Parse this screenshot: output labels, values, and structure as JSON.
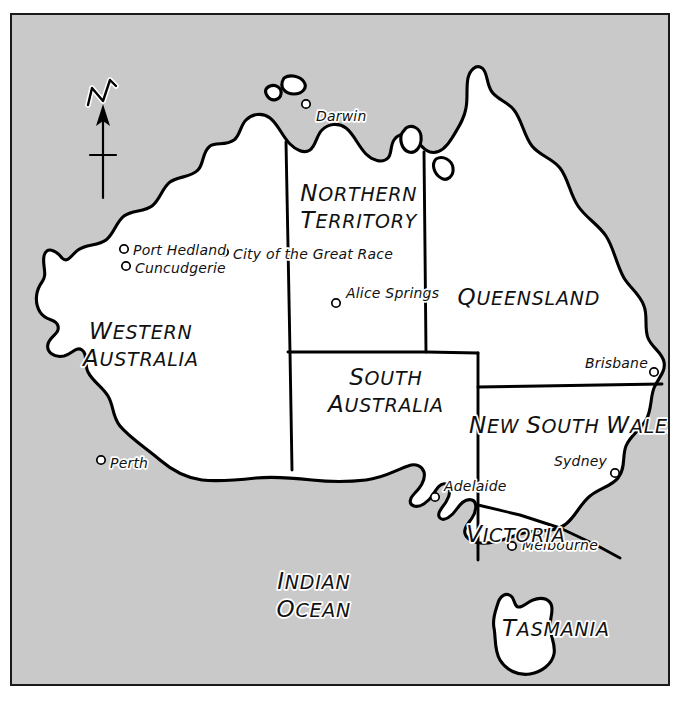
{
  "map": {
    "title": "Map of Australia",
    "background_color": "#c9c9c9",
    "land_color": "#ffffff",
    "outline_color": "#000000",
    "frame_color": "#1a1a1a",
    "compass": {
      "label": "N",
      "icon": "north-arrow-icon"
    },
    "states": [
      {
        "id": "western-australia",
        "line1": "W",
        "line1rest": "ESTERN",
        "line2": "A",
        "line2rest": "USTRALIA",
        "x": 134,
        "y": 339,
        "line_gap": 27
      },
      {
        "id": "northern-territory",
        "line1": "N",
        "line1rest": "ORTHERN",
        "line2": "T",
        "line2rest": "ERRITORY",
        "x": 300,
        "y": 201,
        "line_gap": 27
      },
      {
        "id": "south-australia",
        "line1": "S",
        "line1rest": "OUTH",
        "line2": "A",
        "line2rest": "USTRALIA",
        "x": 327,
        "y": 385,
        "line_gap": 27
      },
      {
        "id": "queensland",
        "line1": "Q",
        "line1rest": "UEENSLAND",
        "line2": "",
        "line2rest": "",
        "x": 468,
        "y": 297,
        "line_gap": 0
      },
      {
        "id": "new-south-wales",
        "line1": "N",
        "line1rest": "EW ",
        "line2": "",
        "line2rest": "",
        "x": 472,
        "y": 425,
        "line_gap": 0,
        "full": "NEW SOUTH WALES"
      },
      {
        "id": "victoria",
        "line1": "V",
        "line1rest": "ICTORIA",
        "line2": "",
        "line2rest": "",
        "x": 463,
        "y": 534,
        "line_gap": 0
      },
      {
        "id": "tasmania",
        "line1": "T",
        "line1rest": "ASMANIA",
        "line2": "",
        "line2rest": "",
        "x": 489,
        "y": 628,
        "line_gap": 0
      }
    ],
    "state_names": {
      "western_australia": "WESTERN AUSTRALIA",
      "northern_territory": "NORTHERN TERRITORY",
      "south_australia": "SOUTH AUSTRALIA",
      "queensland": "QUEENSLAND",
      "new_south_wales": "NEW SOUTH WALES",
      "victoria": "VICTORIA",
      "tasmania": "TASMANIA"
    },
    "ocean": {
      "name": "INDIAN OCEAN",
      "line1": "I",
      "line1rest": "NDIAN",
      "line2": "O",
      "line2rest": "CEAN",
      "x": 262,
      "y": 581
    },
    "cities": [
      {
        "name": "Darwin",
        "dot_x": 306,
        "dot_y": 104,
        "label_x": 316,
        "label_y": 121,
        "anchor": "start"
      },
      {
        "name": "Port Hedland",
        "dot_x": 124,
        "dot_y": 249,
        "label_x": 133,
        "label_y": 255,
        "anchor": "start"
      },
      {
        "name": "Cuncudgerie",
        "dot_x": 126,
        "dot_y": 266,
        "label_x": 135,
        "label_y": 273,
        "anchor": "start"
      },
      {
        "name": "City of the Great Race",
        "dot_x": 224,
        "dot_y": 252,
        "label_x": 233,
        "label_y": 259,
        "anchor": "start"
      },
      {
        "name": "Alice Springs",
        "dot_x": 336,
        "dot_y": 303,
        "label_x": 346,
        "label_y": 298,
        "anchor": "start"
      },
      {
        "name": "Brisbane",
        "dot_x": 654,
        "dot_y": 372,
        "label_x": 648,
        "label_y": 368,
        "anchor": "end"
      },
      {
        "name": "Perth",
        "dot_x": 101,
        "dot_y": 460,
        "label_x": 110,
        "label_y": 468,
        "anchor": "start"
      },
      {
        "name": "Sydney",
        "dot_x": 615,
        "dot_y": 473,
        "label_x": 607,
        "label_y": 466,
        "anchor": "end"
      },
      {
        "name": "Adelaide",
        "dot_x": 435,
        "dot_y": 497,
        "label_x": 444,
        "label_y": 491,
        "anchor": "start"
      },
      {
        "name": "Melbourne",
        "dot_x": 512,
        "dot_y": 546,
        "label_x": 522,
        "label_y": 550,
        "anchor": "start"
      }
    ],
    "city_names": [
      "Darwin",
      "Port Hedland",
      "Cuncudgerie",
      "City of the Great Race",
      "Alice Springs",
      "Brisbane",
      "Perth",
      "Sydney",
      "Adelaide",
      "Melbourne"
    ]
  }
}
